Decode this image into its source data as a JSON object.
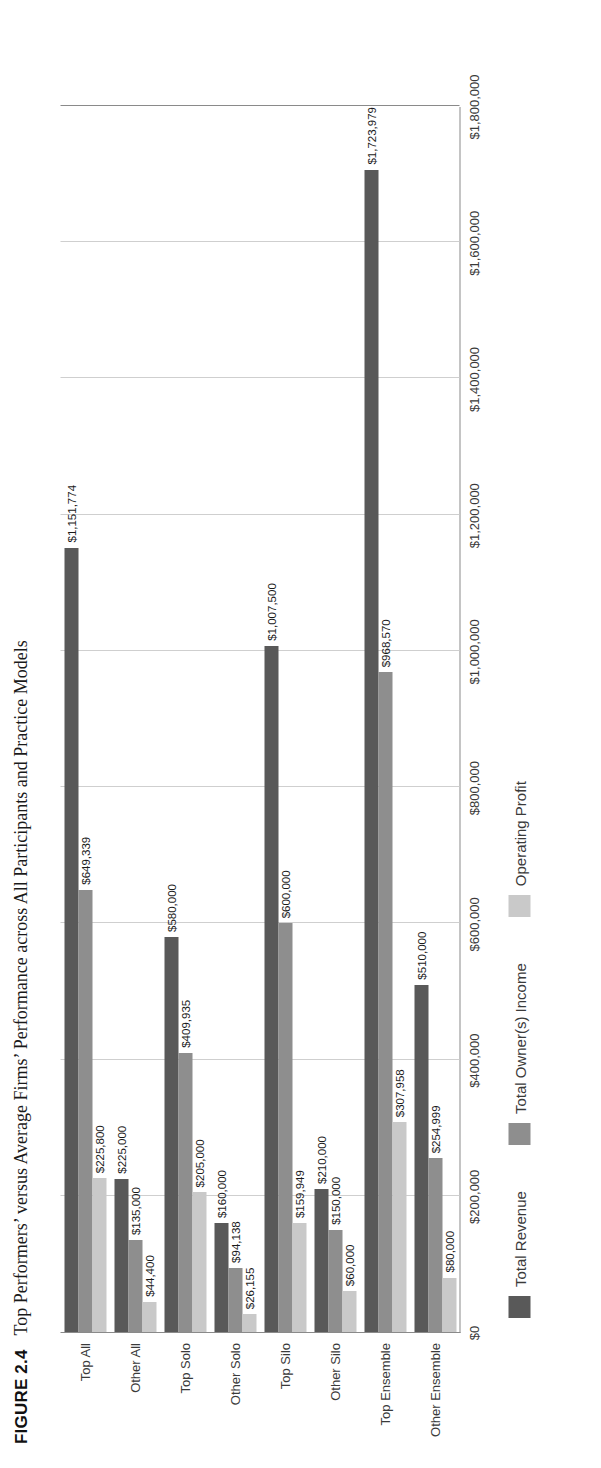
{
  "figure": {
    "number": "FIGURE 2.4",
    "caption": "Top Performers’ versus Average Firms’ Performance across All Participants and Practice Models"
  },
  "legend": {
    "position": "bottom",
    "items": [
      {
        "label": "Total Revenue",
        "color": "#595959"
      },
      {
        "label": "Total Owner(s) Income",
        "color": "#8e8e8e"
      },
      {
        "label": "Operating Profit",
        "color": "#c9c9c9"
      }
    ]
  },
  "axis": {
    "ticks": [
      "$0",
      "$200,000",
      "$400,000",
      "$600,000",
      "$800,000",
      "$1,000,000",
      "$1,200,000",
      "$1,400,000",
      "$1,600,000",
      "$1,800,000"
    ]
  },
  "chart_data": {
    "type": "bar",
    "orientation": "horizontal",
    "title": "Top Performers’ versus Average Firms’ Performance across All Participants and Practice Models",
    "xlabel": "",
    "ylabel": "",
    "xlim": [
      0,
      1800000
    ],
    "grid": true,
    "legend_position": "bottom",
    "categories": [
      "Top All",
      "Other All",
      "Top Solo",
      "Other Solo",
      "Top Silo",
      "Other Silo",
      "Top Ensemble",
      "Other Ensemble"
    ],
    "series": [
      {
        "name": "Total Revenue",
        "color": "#595959",
        "values": [
          1151774,
          225000,
          580000,
          160000,
          1007500,
          210000,
          1723979,
          510000
        ],
        "labels": [
          "$1,151,774",
          "$225,000",
          "$580,000",
          "$160,000",
          "$1,007,500",
          "$210,000",
          "$1,723,979",
          "$510,000"
        ]
      },
      {
        "name": "Total Owner(s) Income",
        "color": "#8e8e8e",
        "values": [
          649339,
          135000,
          409935,
          94138,
          600000,
          150000,
          968570,
          254999
        ],
        "labels": [
          "$649,339",
          "$135,000",
          "$409,935",
          "$94,138",
          "$600,000",
          "$150,000",
          "$968,570",
          "$254,999"
        ]
      },
      {
        "name": "Operating Profit",
        "color": "#c9c9c9",
        "values": [
          225800,
          44400,
          205000,
          26155,
          159949,
          60000,
          307958,
          80000
        ],
        "labels": [
          "$225,800",
          "$44,400",
          "$205,000",
          "$26,155",
          "$159,949",
          "$60,000",
          "$307,958",
          "$80,000"
        ]
      }
    ]
  }
}
